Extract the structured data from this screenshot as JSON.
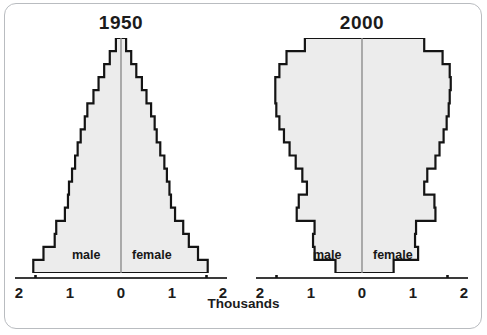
{
  "figure": {
    "xlabel": "Thousands",
    "male_label": "male",
    "female_label": "female",
    "tick_labels": [
      "2",
      "1",
      "0",
      "1",
      "2"
    ],
    "frame_color": "#b9bcc0",
    "outline_color": "#141414",
    "fill_color": "#ececec",
    "text_color": "#1b1b1b"
  },
  "panels": [
    {
      "title": "1950"
    },
    {
      "title": "2000"
    }
  ],
  "chart_data": [
    {
      "type": "bar",
      "subtype": "population-pyramid",
      "title": "1950",
      "xlabel": "Thousands",
      "ylabel": "",
      "xlim": [
        -2,
        2
      ],
      "xticks": [
        -2,
        -1,
        0,
        1,
        2
      ],
      "xticklabels": [
        "2",
        "1",
        "0",
        "1",
        "2"
      ],
      "grid": false,
      "legend": "inline",
      "orientation": "horizontal",
      "bin_count": 18,
      "categories": [
        "0-4",
        "5-9",
        "10-14",
        "15-19",
        "20-24",
        "25-29",
        "30-34",
        "35-39",
        "40-44",
        "45-49",
        "50-54",
        "55-59",
        "60-64",
        "65-69",
        "70-74",
        "75-79",
        "80-84",
        "85+"
      ],
      "series": [
        {
          "name": "male",
          "side": "left",
          "units": "thousands",
          "values": [
            1.72,
            1.52,
            1.3,
            1.27,
            1.1,
            1.04,
            1.02,
            0.96,
            0.9,
            0.85,
            0.79,
            0.71,
            0.66,
            0.54,
            0.44,
            0.33,
            0.22,
            0.1
          ]
        },
        {
          "name": "female",
          "side": "right",
          "units": "thousands",
          "values": [
            1.7,
            1.51,
            1.33,
            1.22,
            1.06,
            0.98,
            0.95,
            0.9,
            0.85,
            0.77,
            0.7,
            0.66,
            0.59,
            0.5,
            0.41,
            0.3,
            0.2,
            0.1
          ]
        }
      ]
    },
    {
      "type": "bar",
      "subtype": "population-pyramid",
      "title": "2000",
      "xlabel": "Thousands",
      "ylabel": "",
      "xlim": [
        -2,
        2
      ],
      "xticks": [
        -2,
        -1,
        0,
        1,
        2
      ],
      "xticklabels": [
        "2",
        "1",
        "0",
        "1",
        "2"
      ],
      "grid": false,
      "legend": "inline",
      "orientation": "horizontal",
      "bin_count": 18,
      "categories": [
        "0-4",
        "5-9",
        "10-14",
        "15-19",
        "20-24",
        "25-29",
        "30-34",
        "35-39",
        "40-44",
        "45-49",
        "50-54",
        "55-59",
        "60-64",
        "65-69",
        "70-74",
        "75-79",
        "80-84",
        "85+"
      ],
      "series": [
        {
          "name": "male",
          "side": "left",
          "units": "thousands",
          "values": [
            0.52,
            0.93,
            0.96,
            0.93,
            1.28,
            1.24,
            1.08,
            1.17,
            1.3,
            1.42,
            1.53,
            1.62,
            1.68,
            1.7,
            1.7,
            1.62,
            1.48,
            1.12
          ]
        },
        {
          "name": "female",
          "side": "right",
          "units": "thousands",
          "values": [
            0.62,
            1.1,
            1.04,
            1.06,
            1.44,
            1.42,
            1.22,
            1.28,
            1.44,
            1.52,
            1.6,
            1.66,
            1.7,
            1.72,
            1.74,
            1.72,
            1.58,
            1.22
          ]
        }
      ]
    }
  ]
}
